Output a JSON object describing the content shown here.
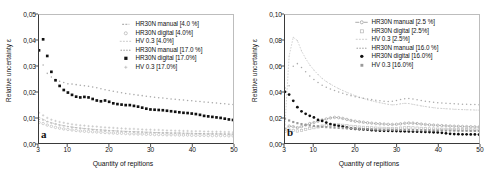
{
  "figure": {
    "panels": [
      {
        "tag": "a",
        "ylabel": "Relative uncertainty ε",
        "xlabel": "Quantity of repitions",
        "yticks": [
          "0,00",
          "0,01",
          "0,02",
          "0,03",
          "0,04",
          "0,05"
        ],
        "xticks": [
          "3",
          "10",
          "20",
          "30",
          "40",
          "50"
        ]
      },
      {
        "tag": "b",
        "ylabel": "Relative uncertainty ε",
        "xlabel": "Quantity of repitions",
        "yticks": [
          "0,00",
          "0,02",
          "0,04",
          "0,06",
          "0,08",
          "0,10"
        ],
        "xticks": [
          "3",
          "10",
          "20",
          "30",
          "40",
          "50"
        ]
      }
    ]
  },
  "chart_data": [
    {
      "type": "scatter",
      "panel": "a",
      "title": "",
      "xlabel": "Quantity of repitions",
      "ylabel": "Relative uncertainty ε",
      "xlim": [
        3,
        50
      ],
      "ylim": [
        0.0,
        0.05
      ],
      "xticks": [
        3,
        10,
        20,
        30,
        40,
        50
      ],
      "yticks": [
        0.0,
        0.01,
        0.02,
        0.03,
        0.04,
        0.05
      ],
      "grid": false,
      "legend_position": "upper-right",
      "x": [
        3,
        4,
        5,
        6,
        7,
        8,
        9,
        10,
        11,
        12,
        13,
        14,
        15,
        16,
        17,
        18,
        19,
        20,
        21,
        22,
        23,
        24,
        25,
        26,
        27,
        28,
        29,
        30,
        31,
        32,
        33,
        34,
        35,
        36,
        37,
        38,
        39,
        40,
        41,
        42,
        43,
        44,
        45,
        46,
        47,
        48,
        49,
        50
      ],
      "series": [
        {
          "name": "HR30N manual [4.0 %]",
          "marker": "dash",
          "color": "#9a9a9a",
          "values": [
            0.0092,
            0.009,
            0.0083,
            0.0078,
            0.0074,
            0.007,
            0.0067,
            0.0064,
            0.0062,
            0.006,
            0.0058,
            0.0056,
            0.0055,
            0.0053,
            0.0052,
            0.0051,
            0.005,
            0.0049,
            0.0048,
            0.0047,
            0.0046,
            0.0045,
            0.0045,
            0.0044,
            0.0043,
            0.0043,
            0.0042,
            0.0042,
            0.0041,
            0.0041,
            0.004,
            0.004,
            0.0039,
            0.0039,
            0.0039,
            0.0038,
            0.0038,
            0.0038,
            0.0037,
            0.0037,
            0.0037,
            0.0036,
            0.0036,
            0.0036,
            0.0036,
            0.0035,
            0.0035,
            0.0035
          ]
        },
        {
          "name": "HR30N digital [4.0%]",
          "marker": "open-circle",
          "color": "#b5b5b5",
          "values": [
            0.008,
            0.0076,
            0.007,
            0.0065,
            0.0061,
            0.0058,
            0.0055,
            0.0053,
            0.0051,
            0.0049,
            0.0047,
            0.0046,
            0.0045,
            0.0044,
            0.0043,
            0.0042,
            0.0041,
            0.004,
            0.0039,
            0.0038,
            0.0038,
            0.0037,
            0.0036,
            0.0036,
            0.0035,
            0.0035,
            0.0034,
            0.0034,
            0.0033,
            0.0033,
            0.0033,
            0.0032,
            0.0032,
            0.0032,
            0.0031,
            0.0031,
            0.0031,
            0.003,
            0.003,
            0.003,
            0.003,
            0.0029,
            0.0029,
            0.0029,
            0.0029,
            0.0029,
            0.0028,
            0.0028
          ]
        },
        {
          "name": "HV 0.3 [4.0%]",
          "marker": "line",
          "color": "#c2c2c2",
          "values": [
            0.01,
            0.0093,
            0.0085,
            0.0079,
            0.0075,
            0.0071,
            0.0068,
            0.0065,
            0.0062,
            0.006,
            0.0058,
            0.0057,
            0.0055,
            0.0054,
            0.0052,
            0.0051,
            0.005,
            0.0049,
            0.0048,
            0.0047,
            0.0046,
            0.0046,
            0.0045,
            0.0044,
            0.0044,
            0.0043,
            0.0042,
            0.0042,
            0.0041,
            0.0041,
            0.004,
            0.004,
            0.0039,
            0.0039,
            0.0039,
            0.0038,
            0.0038,
            0.0037,
            0.0037,
            0.0037,
            0.0036,
            0.0036,
            0.0036,
            0.0036,
            0.0035,
            0.0035,
            0.0035,
            0.0034
          ]
        },
        {
          "name": "HR30N manual [17.0 %]",
          "marker": "small-dot",
          "color": "#a8a8a8",
          "values": [
            0.036,
            0.0305,
            0.0272,
            0.0258,
            0.0248,
            0.0241,
            0.0236,
            0.0231,
            0.023,
            0.0228,
            0.0226,
            0.0224,
            0.0222,
            0.0219,
            0.0216,
            0.0212,
            0.0208,
            0.0205,
            0.0202,
            0.0199,
            0.0196,
            0.0193,
            0.0191,
            0.0189,
            0.0187,
            0.0185,
            0.0183,
            0.0181,
            0.0179,
            0.0177,
            0.0176,
            0.0174,
            0.0172,
            0.0171,
            0.0169,
            0.0168,
            0.0166,
            0.0165,
            0.0163,
            0.0162,
            0.016,
            0.0159,
            0.0157,
            0.0156,
            0.0154,
            0.0153,
            0.0151,
            0.015
          ]
        },
        {
          "name": "HR30N digital [17.0%]",
          "marker": "filled-square",
          "color": "#111111",
          "values": [
            0.0362,
            0.0405,
            0.034,
            0.0278,
            0.0245,
            0.0223,
            0.0207,
            0.0197,
            0.0188,
            0.0181,
            0.0178,
            0.018,
            0.0178,
            0.0172,
            0.0166,
            0.0163,
            0.0166,
            0.0161,
            0.0155,
            0.0152,
            0.015,
            0.0148,
            0.0148,
            0.0145,
            0.0142,
            0.0138,
            0.0134,
            0.0131,
            0.013,
            0.0129,
            0.0128,
            0.0126,
            0.0124,
            0.0122,
            0.012,
            0.0118,
            0.0117,
            0.0115,
            0.0113,
            0.011,
            0.0106,
            0.0104,
            0.0102,
            0.01,
            0.0098,
            0.0095,
            0.0092,
            0.009
          ]
        },
        {
          "name": "HV 0.3 [17.0%]",
          "marker": "plus",
          "color": "#bcbcbc",
          "values": [
            0.0118,
            0.0108,
            0.0098,
            0.0091,
            0.0086,
            0.0082,
            0.0079,
            0.0076,
            0.0073,
            0.0071,
            0.0069,
            0.0068,
            0.0066,
            0.0065,
            0.0064,
            0.0062,
            0.0061,
            0.006,
            0.0059,
            0.0058,
            0.0057,
            0.0056,
            0.0055,
            0.0055,
            0.0054,
            0.0053,
            0.0052,
            0.0052,
            0.0051,
            0.0051,
            0.005,
            0.0049,
            0.0049,
            0.0048,
            0.0048,
            0.0047,
            0.0047,
            0.0046,
            0.0046,
            0.0046,
            0.0045,
            0.0045,
            0.0044,
            0.0044,
            0.0044,
            0.0043,
            0.0043,
            0.0042
          ]
        }
      ]
    },
    {
      "type": "scatter",
      "panel": "b",
      "title": "",
      "xlabel": "Quantity of repitions",
      "ylabel": "Relative uncertainty ε",
      "xlim": [
        3,
        50
      ],
      "ylim": [
        0.0,
        0.1
      ],
      "xticks": [
        3,
        10,
        20,
        30,
        40,
        50
      ],
      "yticks": [
        0.0,
        0.02,
        0.04,
        0.06,
        0.08,
        0.1
      ],
      "grid": false,
      "legend_position": "upper-right",
      "x": [
        3,
        4,
        5,
        6,
        7,
        8,
        9,
        10,
        11,
        12,
        13,
        14,
        15,
        16,
        17,
        18,
        19,
        20,
        21,
        22,
        23,
        24,
        25,
        26,
        27,
        28,
        29,
        30,
        31,
        32,
        33,
        34,
        35,
        36,
        37,
        38,
        39,
        40,
        41,
        42,
        43,
        44,
        45,
        46,
        47,
        48,
        49,
        50
      ],
      "series": [
        {
          "name": "HR30N manual [2.5 %]",
          "marker": "open-circle-line",
          "color": "#9e9e9e",
          "values": [
            0.011,
            0.0132,
            0.0128,
            0.012,
            0.0128,
            0.014,
            0.0152,
            0.016,
            0.017,
            0.018,
            0.0188,
            0.0196,
            0.02,
            0.0198,
            0.0192,
            0.0184,
            0.0176,
            0.017,
            0.0166,
            0.0162,
            0.0158,
            0.0155,
            0.0152,
            0.015,
            0.0148,
            0.0146,
            0.0145,
            0.0146,
            0.015,
            0.0154,
            0.0156,
            0.0155,
            0.0152,
            0.0148,
            0.0145,
            0.0142,
            0.014,
            0.0138,
            0.0136,
            0.0134,
            0.0132,
            0.0131,
            0.013,
            0.0129,
            0.0128,
            0.0127,
            0.0126,
            0.0125
          ]
        },
        {
          "name": "HR30N digital [2.5%]",
          "marker": "open-square",
          "color": "#bcbcbc",
          "values": [
            0.009,
            0.01,
            0.0098,
            0.0094,
            0.0098,
            0.0106,
            0.0114,
            0.012,
            0.0126,
            0.0132,
            0.0136,
            0.014,
            0.0142,
            0.0141,
            0.0138,
            0.0134,
            0.013,
            0.0127,
            0.0124,
            0.0122,
            0.012,
            0.0118,
            0.0116,
            0.0115,
            0.0114,
            0.0113,
            0.0112,
            0.0113,
            0.0116,
            0.0118,
            0.0119,
            0.0118,
            0.0116,
            0.0114,
            0.0112,
            0.011,
            0.0109,
            0.0108,
            0.0107,
            0.0106,
            0.0105,
            0.0104,
            0.0104,
            0.0103,
            0.0103,
            0.0102,
            0.0102,
            0.0101
          ]
        },
        {
          "name": "HV 0.3 [2.5%]",
          "marker": "line",
          "color": "#c8c8c8",
          "values": [
            0.014,
            0.068,
            0.0826,
            0.08,
            0.072,
            0.066,
            0.061,
            0.057,
            0.0535,
            0.0505,
            0.048,
            0.046,
            0.0442,
            0.0425,
            0.041,
            0.0396,
            0.0382,
            0.037,
            0.0358,
            0.0348,
            0.0338,
            0.033,
            0.0322,
            0.0315,
            0.0308,
            0.0302,
            0.0298,
            0.03,
            0.0306,
            0.031,
            0.0308,
            0.0302,
            0.0296,
            0.029,
            0.0285,
            0.028,
            0.0276,
            0.0272,
            0.027,
            0.0268,
            0.0266,
            0.0264,
            0.0262,
            0.0261,
            0.026,
            0.0259,
            0.0258,
            0.0257
          ]
        },
        {
          "name": "HR30N manual [16.0 %]",
          "marker": "small-dot",
          "color": "#ababab",
          "values": [
            0.043,
            0.0448,
            0.06,
            0.062,
            0.059,
            0.0556,
            0.0524,
            0.0496,
            0.0472,
            0.0452,
            0.0436,
            0.0422,
            0.041,
            0.0398,
            0.0388,
            0.0378,
            0.037,
            0.0362,
            0.0356,
            0.035,
            0.0344,
            0.0339,
            0.0334,
            0.033,
            0.0326,
            0.0324,
            0.0326,
            0.0332,
            0.034,
            0.0346,
            0.0348,
            0.0344,
            0.0338,
            0.0332,
            0.0327,
            0.0322,
            0.0318,
            0.0315,
            0.0312,
            0.031,
            0.0308,
            0.0306,
            0.0304,
            0.0303,
            0.0302,
            0.0301,
            0.03,
            0.0299
          ]
        },
        {
          "name": "HR30N digital [16.0%]",
          "marker": "filled-circle",
          "color": "#111111",
          "values": [
            0.04,
            0.0378,
            0.033,
            0.028,
            0.0248,
            0.0228,
            0.0212,
            0.02,
            0.018,
            0.0172,
            0.016,
            0.0148,
            0.014,
            0.0134,
            0.0128,
            0.012,
            0.0113,
            0.011,
            0.0108,
            0.0106,
            0.0104,
            0.01,
            0.0098,
            0.0096,
            0.0095,
            0.0095,
            0.0094,
            0.0093,
            0.0092,
            0.0091,
            0.009,
            0.0089,
            0.0088,
            0.0087,
            0.0086,
            0.0085,
            0.0084,
            0.0083,
            0.008,
            0.0076,
            0.0072,
            0.007,
            0.0069,
            0.0068,
            0.0068,
            0.0067,
            0.0067,
            0.0066
          ]
        },
        {
          "name": "HV 0.3 [16.0%]",
          "marker": "filled-square-gray",
          "color": "#9a9a9a",
          "values": [
            0.019,
            0.0176,
            0.0164,
            0.0155,
            0.0148,
            0.0142,
            0.0137,
            0.0133,
            0.013,
            0.0127,
            0.0124,
            0.0122,
            0.012,
            0.0118,
            0.0116,
            0.0114,
            0.0113,
            0.0112,
            0.011,
            0.0109,
            0.0108,
            0.0107,
            0.0106,
            0.0105,
            0.0104,
            0.0104,
            0.0103,
            0.0103,
            0.0102,
            0.0102,
            0.0101,
            0.0101,
            0.01,
            0.01,
            0.0099,
            0.0099,
            0.0098,
            0.0098,
            0.0098,
            0.0097,
            0.0097,
            0.0097,
            0.0096,
            0.0096,
            0.0096,
            0.0095,
            0.0095,
            0.0095
          ]
        }
      ]
    }
  ]
}
